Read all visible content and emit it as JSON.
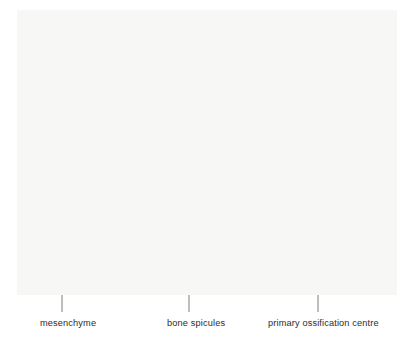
{
  "figure": {
    "kind": "biology-diagram",
    "panel": {
      "x": 17,
      "y": 10,
      "width": 380,
      "height": 285,
      "background_color": "#f7f7f5"
    },
    "colors": {
      "page_background": "#ffffff",
      "panel_background": "#f7f7f5",
      "bone_matrix_core": "#a9a9a9",
      "bone_matrix_rim": "#cfcfcf",
      "spicule_plume": "#d8d8d8",
      "osteoblast_fill": "#ffffff",
      "outline": "#3a3a3a",
      "nucleus": "#1b1b1b",
      "leader_line": "#6e6e6e",
      "label_text": "#2b2b2b"
    }
  },
  "labels": [
    {
      "id": "mesenchyme",
      "text": "mesenchyme",
      "x": 40,
      "y": 318,
      "leader": {
        "x": 62,
        "y1": 272,
        "y2": 312
      }
    },
    {
      "id": "bone-spicules",
      "text": "bone spicules",
      "x": 167,
      "y": 318,
      "leader": {
        "x": 189,
        "y1": 240,
        "y2": 312
      }
    },
    {
      "id": "primary-ossification-centre",
      "text": "primary ossification centre",
      "x": 268,
      "y": 318,
      "leader": {
        "x": 318,
        "y1": 215,
        "y2": 312
      }
    }
  ],
  "ossification_centre": {
    "name": "primary ossification centre",
    "core": {
      "cx": 308,
      "cy": 168,
      "rx": 42,
      "ry": 68
    },
    "rim_thickness": 6,
    "osteoblast_ring_count": 30,
    "lacunae": [
      {
        "cx": 311,
        "cy": 127,
        "note": "osteocyte in lacuna"
      },
      {
        "cx": 290,
        "cy": 158,
        "note": "osteocyte in lacuna"
      },
      {
        "cx": 301,
        "cy": 189,
        "note": "osteocyte in lacuna"
      }
    ]
  },
  "spicule_plume": {
    "name": "bone spicule",
    "cx": 300,
    "cy": 62,
    "rx": 20,
    "ry": 42
  },
  "cell_populations": [
    {
      "id": "mesenchyme-cells",
      "name": "mesenchyme",
      "style": "stellate",
      "count": 30,
      "description": "large sparse star-shaped cells with four concave arms and dotted processes"
    },
    {
      "id": "condensed-cells",
      "name": "condensing mesenchyme / osteoprogenitor cells",
      "style": "stellate-small",
      "count": 26,
      "description": "smaller densely packed stellate cells adjacent to the bone spicules"
    },
    {
      "id": "spicule-cells",
      "name": "osteoblasts within spicule",
      "style": "elongated",
      "count": 9,
      "description": "elongated cells with internal line marks embedded in the spicule plume"
    },
    {
      "id": "osteoblast-ring",
      "name": "osteoblasts lining the ossification centre",
      "style": "cuboidal",
      "count": 30,
      "description": "rounded rectangular cells each with a dark nucleus forming a ring"
    }
  ]
}
